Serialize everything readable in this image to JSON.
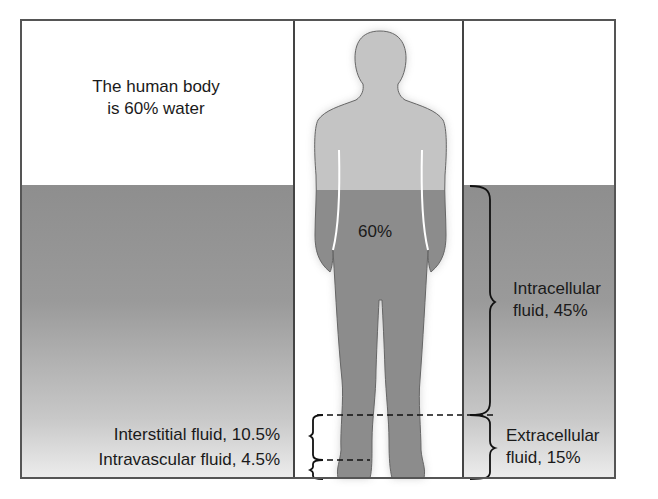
{
  "title": {
    "line1": "The human body",
    "line2": "is 60% water"
  },
  "figure": {
    "percent_label": "60%"
  },
  "intracellular": {
    "line1": "Intracellular",
    "line2": "fluid, 45%"
  },
  "extracellular": {
    "line1": "Extracellular",
    "line2": "fluid, 15%"
  },
  "interstitial": {
    "label": "Interstitial fluid, 10.5%"
  },
  "intravascular": {
    "label": "Intravascular fluid, 4.5%"
  },
  "colors": {
    "water_top": "#8e8e8e",
    "water_bottom": "#ececec",
    "body_upper": "#c4c4c4",
    "body_lower": "#8c8c8c",
    "frame": "#555555"
  }
}
